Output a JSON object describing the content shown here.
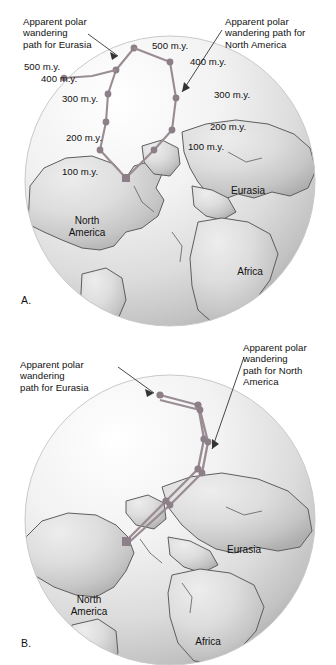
{
  "figure": {
    "type": "diagram",
    "panels": [
      {
        "letter": "A.",
        "description": "Present-day globe showing two separate apparent polar wandering paths",
        "callouts": [
          {
            "id": "eurasia-callout-a",
            "text": "Apparent polar\nwandering\npath for Eurasia"
          },
          {
            "id": "north-america-callout-a",
            "text": "Apparent polar\nwandering path for\nNorth America"
          }
        ],
        "continents": [
          {
            "name": "North\nAmerica"
          },
          {
            "name": "Eurasia"
          },
          {
            "name": "Africa"
          }
        ],
        "path_eurasia": {
          "name": "Apparent polar wandering path for Eurasia",
          "color": "#9a8c93",
          "points": [
            {
              "age": "500 m.y.",
              "label": "500 m.y."
            },
            {
              "age": "400 m.y.",
              "label": "400 m.y."
            },
            {
              "age": "300 m.y.",
              "label": "300 m.y."
            },
            {
              "age": "200 m.y.",
              "label": "200 m.y."
            },
            {
              "age": "100 m.y.",
              "label": "100 m.y."
            },
            {
              "age": "present",
              "label": ""
            }
          ]
        },
        "path_north_america": {
          "name": "Apparent polar wandering path for North America",
          "color": "#9a8c93",
          "points": [
            {
              "age": "500 m.y.",
              "label": "500 m.y."
            },
            {
              "age": "400 m.y.",
              "label": "400 m.y."
            },
            {
              "age": "300 m.y.",
              "label": "300 m.y."
            },
            {
              "age": "200 m.y.",
              "label": "200 m.y."
            },
            {
              "age": "100 m.y.",
              "label": "100 m.y."
            },
            {
              "age": "present",
              "label": ""
            }
          ]
        }
      },
      {
        "letter": "B.",
        "description": "Globe with continents reassembled so the two polar wandering paths coincide",
        "callouts": [
          {
            "id": "eurasia-callout-b",
            "text": "Apparent polar\nwandering\npath for Eurasia"
          },
          {
            "id": "north-america-callout-b",
            "text": "Apparent polar\nwandering\npath for North\nAmerica"
          }
        ],
        "continents": [
          {
            "name": "North\nAmerica"
          },
          {
            "name": "Eurasia"
          },
          {
            "name": "Africa"
          }
        ],
        "path_color": "#9a8c93"
      }
    ],
    "colors": {
      "path": "#9a8c93",
      "marker": "#8d7f87",
      "globe_light": "#fdfdfd",
      "globe_mid": "#e6e6e6",
      "globe_dark": "#b8b8b8",
      "land": "#cfcfcf",
      "coastline": "#5d5d5d",
      "text": "#111111"
    }
  }
}
